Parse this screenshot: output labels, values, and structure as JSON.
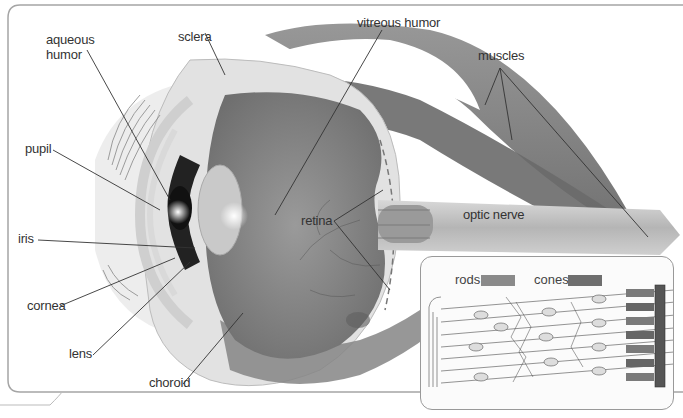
{
  "figure": {
    "labels": {
      "aqueous_humor": "aqueous\nhumor",
      "aqueous_line1": "aqueous",
      "aqueous_line2": "humor",
      "sclera": "sclera",
      "vitreous_humor": "vitreous humor",
      "muscles": "muscles",
      "pupil": "pupil",
      "iris": "iris",
      "cornea": "cornea",
      "lens": "lens",
      "choroid": "choroid",
      "retina": "retina",
      "optic_nerve": "optic nerve"
    },
    "inset": {
      "title": "retina cell detail",
      "legend": [
        {
          "label": "rods",
          "color": "#8a8a8a"
        },
        {
          "label": "cones",
          "color": "#6e6e6e"
        }
      ]
    }
  },
  "colors": {
    "line": "#333333",
    "frame": "#9a9a9a",
    "muscle": "#7a7a7a",
    "vitreous": "#8e8e8e",
    "sclera": "#e4e4e4"
  }
}
